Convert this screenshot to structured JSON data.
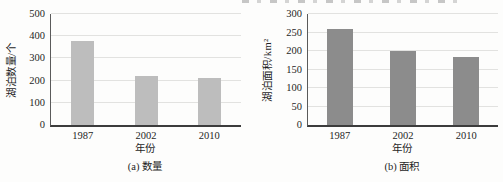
{
  "page": {
    "background": "#fdfdfc",
    "axis_color": "#3c3c3c",
    "gridline_color": "#e2e2e0"
  },
  "chart_data": [
    {
      "type": "bar",
      "caption": "(a) 数量",
      "ylabel": "湖泊数量/个",
      "xlabel": "年份",
      "categories": [
        "1987",
        "2002",
        "2010"
      ],
      "values": [
        380,
        220,
        210
      ],
      "ylim": [
        0,
        500
      ],
      "yticks": [
        0,
        100,
        200,
        300,
        400,
        500
      ],
      "bar_color": "#bdbdbd",
      "grid": "horizontal",
      "legend": "none"
    },
    {
      "type": "bar",
      "caption": "(b) 面积",
      "ylabel": "湖泊面积/km²",
      "xlabel": "年份",
      "categories": [
        "1987",
        "2002",
        "2010"
      ],
      "values": [
        260,
        200,
        185
      ],
      "ylim": [
        0,
        300
      ],
      "yticks": [
        0,
        50,
        100,
        150,
        200,
        250,
        300
      ],
      "bar_color": "#8c8c8c",
      "grid": "horizontal",
      "legend": "none"
    }
  ]
}
